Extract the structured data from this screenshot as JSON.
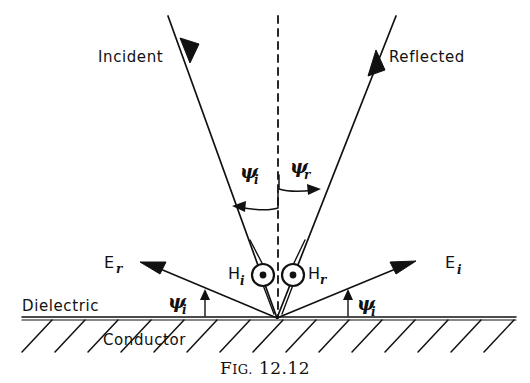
{
  "figure": {
    "caption_prefix_first": "F",
    "caption_prefix_rest": "IG.",
    "caption_number": "12.12",
    "caption_full": "FIG. 12.12",
    "line_color": "#111111",
    "background_color": "#ffffff"
  },
  "labels": {
    "incident": "Incident",
    "reflected": "Reflected",
    "dielectric": "Dielectric",
    "conductor": "Conductor"
  },
  "vectors": {
    "e_reflected_symbol": "E",
    "e_reflected_sub": "r",
    "e_incident_symbol": "E",
    "e_incident_sub": "i",
    "h_incident_symbol": "H",
    "h_incident_sub": "i",
    "h_reflected_symbol": "H",
    "h_reflected_sub": "r",
    "h_out_of_page_icon": "circled-dot-icon"
  },
  "angles": {
    "psi_symbol": "ψ",
    "upper_left_sub": "i",
    "upper_right_sub": "r",
    "lower_left_sub": "i",
    "lower_right_sub": "i"
  },
  "geometry": {
    "origin_x": 277,
    "origin_y": 318,
    "surface_y": 318,
    "surface_x_start": 22,
    "surface_x_end": 516,
    "normal_x": 278,
    "normal_y_top": 16,
    "incident_ray_start_x": 168,
    "incident_ray_start_y": 16,
    "reflected_ray_end_x": 396,
    "reflected_ray_end_y": 16
  }
}
